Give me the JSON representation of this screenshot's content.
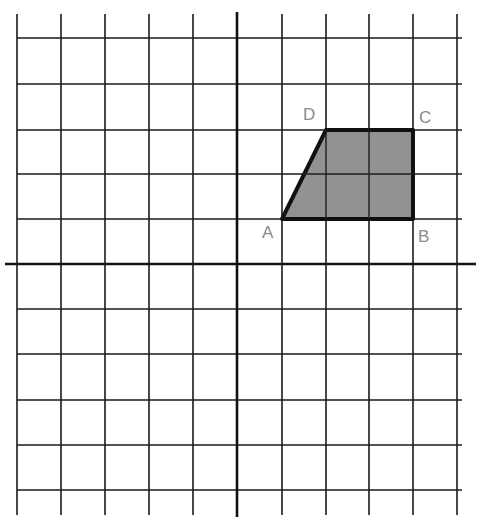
{
  "diagram": {
    "type": "coordinate-grid",
    "grid": {
      "x_lines": [
        17,
        61,
        105,
        149,
        193,
        237,
        282,
        326,
        369,
        413,
        457
      ],
      "y_lines": [
        38,
        84,
        130,
        174,
        219,
        264,
        309,
        354,
        400,
        445,
        490
      ],
      "y_top": 14,
      "y_bottom": 515,
      "x_left": 17,
      "x_right": 462,
      "line_color": "#1a1a1a"
    },
    "axes": {
      "x_axis_y": 264,
      "x_axis_from": 5,
      "x_axis_to": 476,
      "y_axis_x": 237,
      "y_axis_from": 12,
      "y_axis_to": 517,
      "color": "#111111"
    },
    "shape": {
      "name": "trapezoid ABCD",
      "fill": "#8c8c8c",
      "stroke": "#111111",
      "vertices": [
        {
          "label": "A",
          "x": 282,
          "y": 219,
          "label_x": 262,
          "label_y": 238
        },
        {
          "label": "B",
          "x": 413,
          "y": 219,
          "label_x": 418,
          "label_y": 242
        },
        {
          "label": "C",
          "x": 413,
          "y": 130,
          "label_x": 419,
          "label_y": 123
        },
        {
          "label": "D",
          "x": 326,
          "y": 130,
          "label_x": 303,
          "label_y": 120
        }
      ]
    },
    "label_color": "#8a8a8a"
  }
}
